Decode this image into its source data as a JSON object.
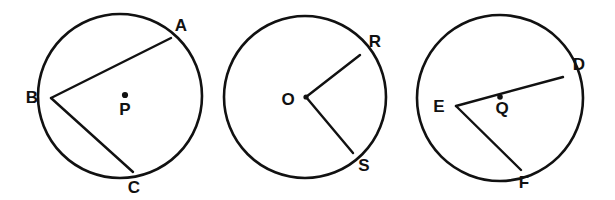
{
  "figure": {
    "background_color": "#ffffff",
    "stroke_color": "#111111",
    "canvas": {
      "width": 615,
      "height": 200
    }
  },
  "circles": [
    {
      "id": "circle-p",
      "center_label": "P",
      "center_label_x": 125,
      "center_label_y": 111,
      "center_dot_x": 125,
      "center_dot_y": 95,
      "center_dot_radius": 3.1,
      "cx": 120,
      "cy": 96,
      "r": 82,
      "has_center_dot": true,
      "points": [
        {
          "label": "A",
          "x": 171,
          "y": 38,
          "label_x": 181,
          "label_y": 27
        },
        {
          "label": "B",
          "x": 51,
          "y": 98,
          "label_x": 32,
          "label_y": 99
        },
        {
          "label": "C",
          "x": 133,
          "y": 172,
          "label_x": 134,
          "label_y": 189
        }
      ],
      "segments": [
        {
          "name": "chord-b-a",
          "from": "B",
          "to": "A",
          "x1": 51,
          "y1": 98,
          "x2": 171,
          "y2": 38
        },
        {
          "name": "chord-b-c",
          "from": "B",
          "to": "C",
          "x1": 51,
          "y1": 98,
          "x2": 133,
          "y2": 172
        }
      ]
    },
    {
      "id": "circle-o",
      "center_label": "O",
      "center_label_x": 288,
      "center_label_y": 101,
      "center_dot_x": 306,
      "center_dot_y": 97,
      "center_dot_radius": 2.6,
      "cx": 305,
      "cy": 97,
      "r": 81,
      "has_center_dot": true,
      "points": [
        {
          "label": "R",
          "x": 360,
          "y": 55,
          "label_x": 375,
          "label_y": 43
        },
        {
          "label": "S",
          "x": 353,
          "y": 153,
          "label_x": 364,
          "label_y": 167
        }
      ],
      "segments": [
        {
          "name": "radius-o-r",
          "from": "O",
          "to": "R",
          "x1": 306,
          "y1": 97,
          "x2": 360,
          "y2": 55
        },
        {
          "name": "radius-o-s",
          "from": "O",
          "to": "S",
          "x1": 306,
          "y1": 97,
          "x2": 353,
          "y2": 153
        }
      ]
    },
    {
      "id": "circle-q",
      "center_label": "Q",
      "center_label_x": 502,
      "center_label_y": 110,
      "center_dot_x": 500,
      "center_dot_y": 97,
      "center_dot_radius": 2.8,
      "cx": 500,
      "cy": 98,
      "r": 83,
      "has_center_dot": true,
      "points": [
        {
          "label": "D",
          "x": 563,
          "y": 77,
          "label_x": 579,
          "label_y": 66
        },
        {
          "label": "E",
          "x": 456,
          "y": 106,
          "label_x": 439,
          "label_y": 108
        },
        {
          "label": "F",
          "x": 521,
          "y": 170,
          "label_x": 524,
          "label_y": 184
        }
      ],
      "segments": [
        {
          "name": "chord-e-d",
          "from": "E",
          "to": "D",
          "x1": 456,
          "y1": 106,
          "x2": 563,
          "y2": 77
        },
        {
          "name": "chord-e-f",
          "from": "E",
          "to": "F",
          "x1": 456,
          "y1": 106,
          "x2": 521,
          "y2": 170
        }
      ]
    }
  ]
}
